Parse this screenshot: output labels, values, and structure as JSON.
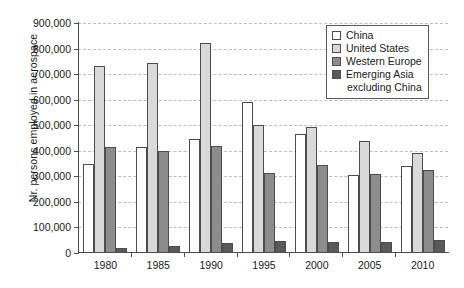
{
  "chart_data": {
    "type": "bar",
    "title": "",
    "xlabel": "",
    "ylabel": "Nr. persons employed in aerospace",
    "categories": [
      "1980",
      "1985",
      "1990",
      "1995",
      "2000",
      "2005",
      "2010"
    ],
    "ylim": [
      0,
      900000
    ],
    "ytick_values": [
      0,
      100000,
      200000,
      300000,
      400000,
      500000,
      600000,
      700000,
      800000,
      900000
    ],
    "ytick_labels": [
      "0",
      "100,000",
      "200,000",
      "300,000",
      "400,000",
      "500,000",
      "600,000",
      "700,000",
      "800,000",
      "900,000"
    ],
    "grid": true,
    "legend_position": "top-right",
    "series": [
      {
        "name": "China",
        "color": "#ffffff",
        "values": [
          350000,
          415000,
          445000,
          590000,
          465000,
          305000,
          340000
        ]
      },
      {
        "name": "United States",
        "color": "#d9d9d9",
        "values": [
          730000,
          745000,
          820000,
          500000,
          495000,
          440000,
          390000
        ]
      },
      {
        "name": "Western Europe",
        "color": "#8c8c8c",
        "values": [
          415000,
          400000,
          420000,
          315000,
          345000,
          310000,
          325000
        ]
      },
      {
        "name": "Emerging Asia excluding China",
        "color": "#595959",
        "values": [
          18000,
          28000,
          38000,
          48000,
          42000,
          45000,
          50000
        ]
      }
    ]
  },
  "legend": {
    "entries": [
      {
        "label": "China",
        "continuation": ""
      },
      {
        "label": "United States",
        "continuation": ""
      },
      {
        "label": "Western Europe",
        "continuation": ""
      },
      {
        "label": "Emerging Asia",
        "continuation": "excluding China"
      }
    ]
  },
  "colors": {
    "china": "#ffffff",
    "united_states": "#d9d9d9",
    "western_europe": "#8c8c8c",
    "emerging_asia": "#595959",
    "axis": "#4d4d4d",
    "grid": "#bfbfbf",
    "text": "#1a1a1a"
  }
}
